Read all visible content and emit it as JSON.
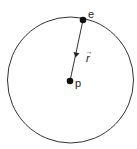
{
  "diagram": {
    "circle": {
      "cx": 70.5,
      "cy": 80,
      "r": 63,
      "stroke": "#333333"
    },
    "points": [
      {
        "id": "e",
        "label": "e",
        "x": 83,
        "y": 20
      },
      {
        "id": "p",
        "label": "p",
        "x": 70,
        "y": 81
      }
    ],
    "vector": {
      "from": "e",
      "to": "p",
      "label": "r",
      "arrow_hat": "→"
    }
  }
}
